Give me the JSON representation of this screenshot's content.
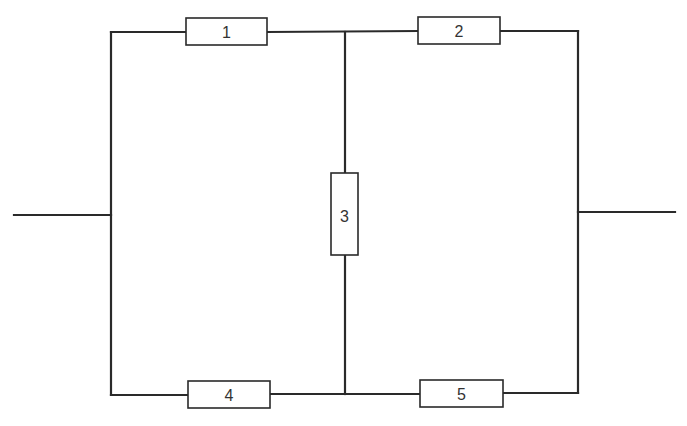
{
  "diagram": {
    "type": "circuit-bridge-network",
    "colors": {
      "line": "#2a2a2a",
      "label": "#333333",
      "background": "#ffffff"
    },
    "components": [
      {
        "id": "1",
        "label": "1",
        "position": "top-left branch"
      },
      {
        "id": "2",
        "label": "2",
        "position": "top-right branch"
      },
      {
        "id": "3",
        "label": "3",
        "position": "center vertical bridge"
      },
      {
        "id": "4",
        "label": "4",
        "position": "bottom-left branch"
      },
      {
        "id": "5",
        "label": "5",
        "position": "bottom-right branch"
      }
    ],
    "terminals": [
      {
        "id": "input",
        "position": "left"
      },
      {
        "id": "output",
        "position": "right"
      }
    ]
  }
}
